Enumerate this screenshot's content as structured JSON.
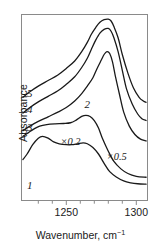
{
  "chart_data": {
    "type": "line",
    "title": "",
    "xlabel": "Wavenumber, cm",
    "xlabel_sup": "−1",
    "ylabel": "Absorbance",
    "xlim": [
      1218,
      1308
    ],
    "ylim": [
      0,
      1.0
    ],
    "grid": false,
    "legend_position": "inline-curve-labels",
    "xticks_major": [
      1250,
      1300
    ],
    "xtick_labels": [
      "1250",
      "1300"
    ],
    "xticks_minor": [
      1230,
      1240,
      1260,
      1270,
      1280,
      1290
    ],
    "yticks": [],
    "annotations": [
      {
        "id": "scale-02",
        "text": "×0.2",
        "x": 1253,
        "y": 0.3
      },
      {
        "id": "scale-05",
        "text": "×0.5",
        "x": 1286,
        "y": 0.22
      }
    ],
    "series": [
      {
        "name": "1",
        "label": "1",
        "label_x": 1222,
        "label_y": 0.06,
        "scale_note": "×0.2",
        "peak_main_x": 1273,
        "peak_main_y": 0.18,
        "peak_secondary_x": 1232,
        "peak_secondary_y": 0.27,
        "points": [
          [
            1219,
            0.22
          ],
          [
            1222,
            0.25
          ],
          [
            1226,
            0.3
          ],
          [
            1230,
            0.335
          ],
          [
            1233,
            0.345
          ],
          [
            1237,
            0.335
          ],
          [
            1241,
            0.315
          ],
          [
            1245,
            0.305
          ],
          [
            1250,
            0.3
          ],
          [
            1254,
            0.3
          ],
          [
            1258,
            0.305
          ],
          [
            1262,
            0.31
          ],
          [
            1265,
            0.305
          ],
          [
            1269,
            0.285
          ],
          [
            1273,
            0.25
          ],
          [
            1277,
            0.2
          ],
          [
            1281,
            0.155
          ],
          [
            1286,
            0.125
          ],
          [
            1291,
            0.105
          ],
          [
            1296,
            0.095
          ],
          [
            1301,
            0.09
          ],
          [
            1307,
            0.088
          ]
        ]
      },
      {
        "name": "2",
        "label": "2",
        "label_x": 1263,
        "label_y": 0.5,
        "scale_note": "×0.2",
        "peak_main_x": 1264,
        "peak_main_y": 0.455,
        "points": [
          [
            1219,
            0.345
          ],
          [
            1223,
            0.365
          ],
          [
            1227,
            0.385
          ],
          [
            1231,
            0.4
          ],
          [
            1236,
            0.408
          ],
          [
            1242,
            0.412
          ],
          [
            1248,
            0.414
          ],
          [
            1253,
            0.418
          ],
          [
            1257,
            0.432
          ],
          [
            1261,
            0.452
          ],
          [
            1264,
            0.458
          ],
          [
            1267,
            0.452
          ],
          [
            1270,
            0.43
          ],
          [
            1273,
            0.39
          ],
          [
            1276,
            0.33
          ],
          [
            1280,
            0.265
          ],
          [
            1284,
            0.21
          ],
          [
            1289,
            0.17
          ],
          [
            1294,
            0.145
          ],
          [
            1300,
            0.13
          ],
          [
            1307,
            0.125
          ]
        ]
      },
      {
        "name": "3",
        "label": "3",
        "label_x": 1222,
        "label_y": 0.375,
        "scale_note": "×0.5",
        "peak_main_x": 1280,
        "peak_main_y": 0.8,
        "points": [
          [
            1219,
            0.375
          ],
          [
            1224,
            0.4
          ],
          [
            1230,
            0.425
          ],
          [
            1237,
            0.45
          ],
          [
            1244,
            0.475
          ],
          [
            1250,
            0.5
          ],
          [
            1256,
            0.535
          ],
          [
            1261,
            0.575
          ],
          [
            1265,
            0.615
          ],
          [
            1269,
            0.66
          ],
          [
            1272,
            0.71
          ],
          [
            1275,
            0.755
          ],
          [
            1277,
            0.785
          ],
          [
            1279,
            0.8
          ],
          [
            1281,
            0.79
          ],
          [
            1283,
            0.745
          ],
          [
            1285,
            0.67
          ],
          [
            1288,
            0.57
          ],
          [
            1291,
            0.475
          ],
          [
            1295,
            0.4
          ],
          [
            1299,
            0.355
          ],
          [
            1303,
            0.33
          ],
          [
            1307,
            0.32
          ]
        ]
      },
      {
        "name": "4",
        "label": "4",
        "label_x": 1222,
        "label_y": 0.47,
        "scale_note": "×0.5",
        "peak_main_x": 1280,
        "peak_main_y": 0.925,
        "points": [
          [
            1219,
            0.47
          ],
          [
            1224,
            0.5
          ],
          [
            1230,
            0.53
          ],
          [
            1237,
            0.56
          ],
          [
            1244,
            0.59
          ],
          [
            1250,
            0.625
          ],
          [
            1256,
            0.665
          ],
          [
            1261,
            0.715
          ],
          [
            1265,
            0.765
          ],
          [
            1268,
            0.815
          ],
          [
            1271,
            0.862
          ],
          [
            1274,
            0.9
          ],
          [
            1277,
            0.92
          ],
          [
            1280,
            0.925
          ],
          [
            1282,
            0.91
          ],
          [
            1284,
            0.875
          ],
          [
            1287,
            0.8
          ],
          [
            1290,
            0.7
          ],
          [
            1293,
            0.6
          ],
          [
            1297,
            0.52
          ],
          [
            1301,
            0.465
          ],
          [
            1304,
            0.44
          ],
          [
            1307,
            0.43
          ]
        ]
      },
      {
        "name": "5",
        "label": "5",
        "label_x": 1222,
        "label_y": 0.555,
        "scale_note": "×0.5",
        "peak_main_x": 1280,
        "peak_main_y": 0.975,
        "points": [
          [
            1219,
            0.555
          ],
          [
            1224,
            0.585
          ],
          [
            1230,
            0.615
          ],
          [
            1237,
            0.645
          ],
          [
            1244,
            0.675
          ],
          [
            1250,
            0.71
          ],
          [
            1256,
            0.75
          ],
          [
            1261,
            0.8
          ],
          [
            1265,
            0.85
          ],
          [
            1268,
            0.895
          ],
          [
            1271,
            0.93
          ],
          [
            1274,
            0.958
          ],
          [
            1277,
            0.972
          ],
          [
            1280,
            0.975
          ],
          [
            1282,
            0.965
          ],
          [
            1284,
            0.935
          ],
          [
            1287,
            0.875
          ],
          [
            1290,
            0.785
          ],
          [
            1294,
            0.685
          ],
          [
            1298,
            0.605
          ],
          [
            1302,
            0.555
          ],
          [
            1305,
            0.535
          ],
          [
            1307,
            0.528
          ]
        ]
      }
    ]
  },
  "figure": {
    "frame_color": "#8a8a8a",
    "curve_color": "#1a1a1a",
    "background": "#ffffff"
  }
}
